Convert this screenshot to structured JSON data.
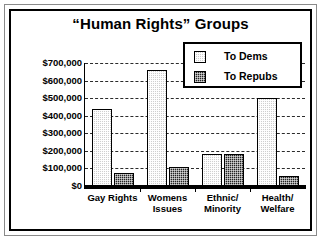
{
  "chart_data": {
    "type": "bar",
    "title": "“Human Rights” Groups",
    "xlabel": "",
    "ylabel": "",
    "ylim": [
      0,
      700000
    ],
    "grid": true,
    "legend_position": "top-right",
    "categories": [
      "Gay Rights",
      "Womens Issues",
      "Ethnic/ Minority",
      "Health/ Welfare"
    ],
    "category_lines": [
      [
        "Gay Rights"
      ],
      [
        "Womens",
        "Issues"
      ],
      [
        "Ethnic/",
        "Minority"
      ],
      [
        "Health/",
        "Welfare"
      ]
    ],
    "ytick_labels": [
      "$700,000",
      "$600,000",
      "$500,000",
      "$400,000",
      "$300,000",
      "$200,000",
      "$100,000",
      "$0"
    ],
    "ytick_values": [
      700000,
      600000,
      500000,
      400000,
      300000,
      200000,
      100000,
      0
    ],
    "series": [
      {
        "name": "To Dems",
        "color": "#cfcfcf",
        "values": [
          440000,
          660000,
          180000,
          500000
        ]
      },
      {
        "name": "To Repubs",
        "color": "#232323",
        "values": [
          75000,
          110000,
          180000,
          55000
        ]
      }
    ]
  },
  "legend": {
    "items": [
      {
        "label": "To Dems"
      },
      {
        "label": "To Repubs"
      }
    ]
  }
}
